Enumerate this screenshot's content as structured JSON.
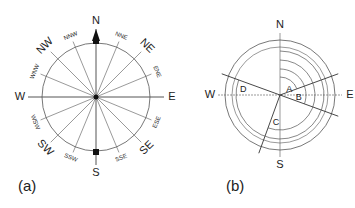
{
  "figure_a": {
    "caption": "(a)",
    "cardinal": [
      "N",
      "E",
      "S",
      "W"
    ],
    "intercardinal": [
      "NE",
      "SE",
      "SW",
      "NW"
    ],
    "secondary": [
      "NNE",
      "ENE",
      "ESE",
      "SSE",
      "SSW",
      "WSW",
      "WNW",
      "NNW"
    ]
  },
  "figure_b": {
    "caption": "(b)",
    "cardinal": [
      "N",
      "E",
      "S",
      "W"
    ],
    "angles": [
      {
        "label": "A",
        "bearing_deg": 70
      },
      {
        "label": "B",
        "bearing_deg": 110
      },
      {
        "label": "C",
        "bearing_deg": 200
      },
      {
        "label": "D",
        "bearing_deg": 290
      }
    ]
  },
  "colors": {
    "line": "#555555",
    "text": "#222222",
    "background": "#ffffff"
  }
}
